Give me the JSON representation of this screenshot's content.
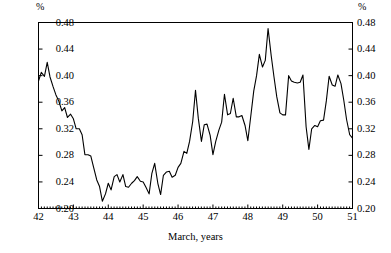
{
  "chart_data": {
    "type": "line",
    "title": "",
    "subtitle": "",
    "xlabel": "March, years",
    "ylabel": "%",
    "ylabel_right": "%",
    "xlim": [
      42,
      51
    ],
    "ylim": [
      0.2,
      0.48
    ],
    "ytick_values": [
      0.2,
      0.24,
      0.28,
      0.32,
      0.36,
      0.4,
      0.44,
      0.48
    ],
    "ytick_labels": [
      "0.20",
      "0.24",
      "0.28",
      "0.32",
      "0.36",
      "0.40",
      "0.44",
      "0.48"
    ],
    "ytick_labels_right": [
      "0.20",
      "0.24",
      "0.28",
      "0.32",
      "0.36",
      "0.40",
      "0.44",
      "0.48"
    ],
    "xtick_values": [
      42,
      43,
      44,
      45,
      46,
      47,
      48,
      49,
      50,
      51
    ],
    "xtick_labels": [
      "42",
      "43",
      "44",
      "45",
      "46",
      "47",
      "48",
      "49",
      "50",
      "51"
    ],
    "minor_xticks_per_major": 12,
    "grid": false,
    "legend": null,
    "line_color": "#000000",
    "frame_color": "#000000",
    "series": [
      {
        "name": "share",
        "x": [
          42.0,
          42.08,
          42.17,
          42.25,
          42.33,
          42.42,
          42.5,
          42.58,
          42.67,
          42.75,
          42.83,
          42.92,
          43.0,
          43.08,
          43.17,
          43.25,
          43.33,
          43.42,
          43.5,
          43.58,
          43.67,
          43.75,
          43.83,
          43.92,
          44.0,
          44.08,
          44.17,
          44.25,
          44.33,
          44.42,
          44.5,
          44.58,
          44.67,
          44.75,
          44.83,
          44.92,
          45.0,
          45.08,
          45.17,
          45.25,
          45.33,
          45.42,
          45.5,
          45.58,
          45.67,
          45.75,
          45.83,
          45.92,
          46.0,
          46.08,
          46.17,
          46.25,
          46.33,
          46.42,
          46.5,
          46.58,
          46.67,
          46.75,
          46.83,
          46.92,
          47.0,
          47.08,
          47.17,
          47.25,
          47.33,
          47.42,
          47.5,
          47.58,
          47.67,
          47.75,
          47.83,
          47.92,
          48.0,
          48.08,
          48.17,
          48.25,
          48.33,
          48.42,
          48.5,
          48.58,
          48.67,
          48.75,
          48.83,
          48.92,
          49.0,
          49.08,
          49.17,
          49.25,
          49.33,
          49.42,
          49.5,
          49.58,
          49.67,
          49.75,
          49.83,
          49.92,
          50.0,
          50.08,
          50.17,
          50.25,
          50.33,
          50.42,
          50.5,
          50.58,
          50.67,
          50.75,
          50.83,
          50.92,
          51.0
        ],
        "y": [
          0.392,
          0.405,
          0.399,
          0.42,
          0.398,
          0.383,
          0.371,
          0.362,
          0.347,
          0.352,
          0.337,
          0.342,
          0.335,
          0.32,
          0.32,
          0.311,
          0.281,
          0.281,
          0.279,
          0.262,
          0.243,
          0.233,
          0.211,
          0.222,
          0.238,
          0.228,
          0.248,
          0.251,
          0.24,
          0.251,
          0.233,
          0.232,
          0.238,
          0.242,
          0.248,
          0.241,
          0.24,
          0.232,
          0.222,
          0.253,
          0.268,
          0.238,
          0.221,
          0.25,
          0.255,
          0.256,
          0.247,
          0.25,
          0.262,
          0.268,
          0.286,
          0.283,
          0.301,
          0.331,
          0.378,
          0.336,
          0.301,
          0.326,
          0.327,
          0.31,
          0.281,
          0.301,
          0.318,
          0.33,
          0.372,
          0.341,
          0.343,
          0.366,
          0.338,
          0.338,
          0.34,
          0.325,
          0.302,
          0.337,
          0.377,
          0.4,
          0.432,
          0.413,
          0.423,
          0.471,
          0.43,
          0.398,
          0.368,
          0.344,
          0.341,
          0.341,
          0.4,
          0.392,
          0.39,
          0.389,
          0.39,
          0.401,
          0.323,
          0.289,
          0.32,
          0.325,
          0.323,
          0.332,
          0.333,
          0.362,
          0.399,
          0.386,
          0.384,
          0.401,
          0.388,
          0.363,
          0.334,
          0.311,
          0.306
        ]
      }
    ]
  },
  "axes": {
    "unit_left": "%",
    "unit_right": "%",
    "xaxis_title": "March, years"
  }
}
